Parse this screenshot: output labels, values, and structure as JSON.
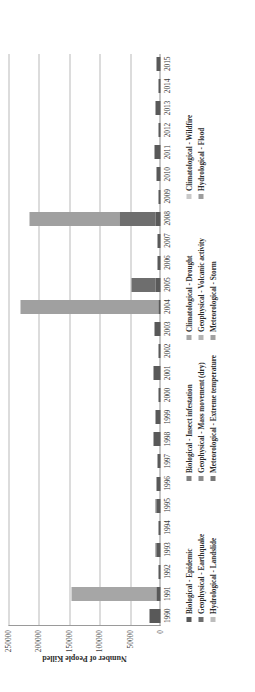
{
  "chart_data": {
    "type": "bar",
    "subtype": "stacked-column",
    "title": "",
    "xlabel": "",
    "ylabel": "Number of People Killed",
    "ylim": [
      0,
      250000
    ],
    "yticks": [
      250000,
      200000,
      150000,
      100000,
      50000,
      0
    ],
    "ytick_labels": [
      "250000",
      "200000",
      "150000",
      "100000",
      "50000",
      "0"
    ],
    "grid": true,
    "grid_axis": "y",
    "legend_position": "bottom",
    "orientation": "rotated-90-ccw",
    "categories": [
      "1990",
      "1991",
      "1992",
      "1993",
      "1994",
      "1995",
      "1996",
      "1997",
      "1998",
      "1999",
      "2000",
      "2001",
      "2002",
      "2003",
      "2004",
      "2005",
      "2006",
      "2007",
      "2008",
      "2009",
      "2010",
      "2011",
      "2012",
      "2013",
      "2014",
      "2015"
    ],
    "series": [
      {
        "name": "Biological - Epidemic",
        "color": "#595959",
        "values": [
          18000,
          7000,
          4000,
          7000,
          3500,
          7000,
          6000,
          5500,
          11000,
          9000,
          3500,
          11000,
          4000,
          10000,
          4000,
          8000,
          5000,
          4500,
          8000,
          2500,
          6500,
          10000,
          3000,
          8500,
          3500,
          6000
        ]
      },
      {
        "name": "Biological - Insect infestation",
        "color": "#808080",
        "values": [
          0,
          0,
          0,
          0,
          0,
          0,
          0,
          0,
          0,
          0,
          0,
          0,
          0,
          0,
          0,
          0,
          0,
          0,
          0,
          0,
          0,
          0,
          0,
          0,
          0,
          0
        ]
      },
      {
        "name": "Climatological - Drought",
        "color": "#a6a6a6",
        "values": [
          0,
          140000,
          0,
          0,
          0,
          0,
          0,
          0,
          0,
          0,
          0,
          0,
          0,
          0,
          0,
          0,
          0,
          0,
          0,
          0,
          0,
          0,
          0,
          0,
          0,
          0
        ]
      },
      {
        "name": "Climatological - Wildfire",
        "color": "#c9c9c9",
        "values": [
          0,
          0,
          0,
          0,
          0,
          0,
          0,
          0,
          0,
          0,
          0,
          0,
          0,
          0,
          0,
          0,
          0,
          0,
          0,
          0,
          0,
          0,
          0,
          0,
          0,
          0
        ]
      },
      {
        "name": "Geophysical - Earthquake",
        "color": "#6e6e6e",
        "values": [
          0,
          0,
          0,
          2000,
          0,
          1000,
          0,
          0,
          0,
          0,
          0,
          0,
          0,
          0,
          0,
          40000,
          0,
          0,
          60000,
          0,
          0,
          0,
          0,
          0,
          0,
          0
        ]
      },
      {
        "name": "Geophysical - Mass movement (dry)",
        "color": "#8c8c8c",
        "values": [
          0,
          0,
          0,
          0,
          0,
          0,
          0,
          0,
          0,
          0,
          0,
          0,
          0,
          0,
          0,
          0,
          0,
          0,
          0,
          0,
          0,
          0,
          0,
          0,
          0,
          0
        ]
      },
      {
        "name": "Geophysical - Volcanic activity",
        "color": "#b3b3b3",
        "values": [
          0,
          0,
          0,
          0,
          0,
          0,
          0,
          0,
          0,
          0,
          0,
          0,
          0,
          0,
          0,
          0,
          0,
          0,
          0,
          0,
          0,
          0,
          0,
          0,
          0,
          0
        ]
      },
      {
        "name": "Hydrological - Flood",
        "color": "#9c9c9c",
        "values": [
          0,
          0,
          0,
          0,
          0,
          0,
          0,
          0,
          0,
          0,
          0,
          0,
          0,
          0,
          0,
          0,
          0,
          0,
          0,
          0,
          0,
          0,
          0,
          0,
          0,
          0
        ]
      },
      {
        "name": "Hydrological - Landslide",
        "color": "#bdbdbd",
        "values": [
          0,
          0,
          0,
          0,
          0,
          0,
          0,
          0,
          0,
          0,
          0,
          0,
          0,
          0,
          0,
          0,
          0,
          0,
          0,
          0,
          0,
          0,
          0,
          0,
          0,
          0
        ]
      },
      {
        "name": "Meteorological - Extreme temperature",
        "color": "#787878",
        "values": [
          0,
          0,
          0,
          0,
          0,
          0,
          0,
          0,
          0,
          0,
          0,
          0,
          0,
          0,
          0,
          0,
          0,
          0,
          0,
          0,
          0,
          0,
          0,
          0,
          0,
          0
        ]
      },
      {
        "name": "Meteorological - Storm",
        "color": "#a0a0a0",
        "values": [
          0,
          0,
          0,
          0,
          0,
          0,
          0,
          0,
          0,
          0,
          0,
          0,
          0,
          0,
          226000,
          0,
          0,
          0,
          147000,
          0,
          0,
          0,
          0,
          0,
          0,
          0
        ]
      }
    ],
    "totals": [
      18000,
      147000,
      4000,
      9000,
      3500,
      8000,
      6000,
      5500,
      11000,
      9000,
      3500,
      11000,
      4000,
      10000,
      230000,
      48000,
      5000,
      4500,
      215000,
      2500,
      6500,
      10000,
      3000,
      8500,
      3500,
      6000
    ],
    "annotations": []
  },
  "legend": {
    "columns": [
      {
        "items": [
          {
            "label": "Biological - Epidemic",
            "color": "#595959"
          },
          {
            "label": "Geophysical - Earthquake",
            "color": "#6e6e6e"
          },
          {
            "label": "Hydrological - Landslide",
            "color": "#bdbdbd"
          }
        ]
      },
      {
        "items": [
          {
            "label": "Biological - Insect infestation",
            "color": "#808080"
          },
          {
            "label": "Geophysical - Mass movement (dry)",
            "color": "#8c8c8c"
          },
          {
            "label": "Meteorological - Extreme temperature",
            "color": "#787878"
          }
        ]
      },
      {
        "items": [
          {
            "label": "Climatological - Drought",
            "color": "#a6a6a6"
          },
          {
            "label": "Geophysical - Volcanic activity",
            "color": "#b3b3b3"
          },
          {
            "label": "Meteorological - Storm",
            "color": "#a0a0a0"
          }
        ]
      },
      {
        "items": [
          {
            "label": "Climatological - Wildfire",
            "color": "#c9c9c9"
          },
          {
            "label": "Hydrological - Flood",
            "color": "#9c9c9c"
          }
        ]
      }
    ]
  }
}
